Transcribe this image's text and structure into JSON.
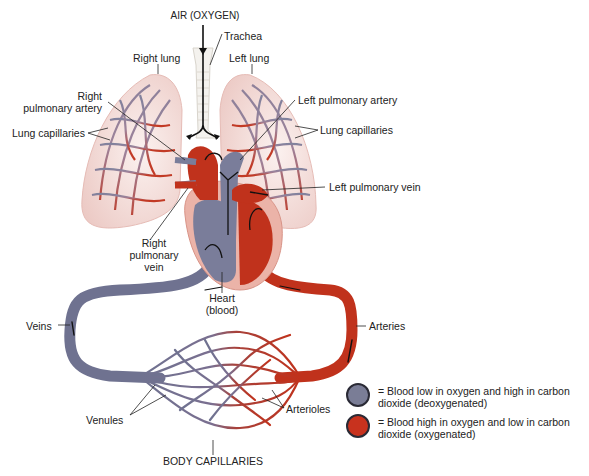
{
  "diagram": {
    "labels": {
      "air": "AIR (OXYGEN)",
      "trachea": "Trachea",
      "right_lung": "Right lung",
      "left_lung": "Left lung",
      "right_pulmonary_artery": "Right\npulmonary artery",
      "right_pulmonary_artery_l1": "Right",
      "right_pulmonary_artery_l2": "pulmonary artery",
      "lung_capillaries_left_side": "Lung capillaries",
      "left_pulmonary_artery": "Left pulmonary artery",
      "lung_capillaries_right_side": "Lung capillaries",
      "left_pulmonary_vein": "Left pulmonary vein",
      "right_pulmonary_vein_l1": "Right",
      "right_pulmonary_vein_l2": "pulmonary",
      "right_pulmonary_vein_l3": "vein",
      "heart_l1": "Heart",
      "heart_l2": "(blood)",
      "veins": "Veins",
      "arteries": "Arteries",
      "venules": "Venules",
      "arterioles": "Arterioles",
      "body_capillaries": "BODY CAPILLARIES"
    },
    "legend": [
      {
        "color": "#7a7d96",
        "text": "= Blood low in oxygen and high in carbon dioxide (deoxygenated)",
        "marker": "deoxygenated-blood-swatch"
      },
      {
        "color": "#c8321e",
        "text": "= Blood high in oxygen and low in carbon dioxide (oxygenated)",
        "marker": "oxygenated-blood-swatch"
      }
    ],
    "colors": {
      "deoxygenated": "#6f7290",
      "oxygenated": "#c0321c",
      "lung_tissue": "#f2d8d4",
      "heart_tissue": "#ebb3a8"
    }
  }
}
